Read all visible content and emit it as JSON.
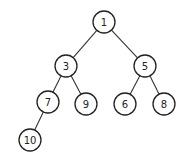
{
  "diagram": {
    "type": "binary-tree",
    "nodes": [
      {
        "id": "n1",
        "label": "1",
        "x": 104,
        "y": 22
      },
      {
        "id": "n3",
        "label": "3",
        "x": 66,
        "y": 66
      },
      {
        "id": "n5",
        "label": "5",
        "x": 145,
        "y": 66
      },
      {
        "id": "n7",
        "label": "7",
        "x": 48,
        "y": 102
      },
      {
        "id": "n9",
        "label": "9",
        "x": 86,
        "y": 104
      },
      {
        "id": "n6",
        "label": "6",
        "x": 125,
        "y": 104
      },
      {
        "id": "n8",
        "label": "8",
        "x": 164,
        "y": 104
      },
      {
        "id": "n10",
        "label": "10",
        "x": 30,
        "y": 140
      }
    ],
    "edges": [
      [
        "n1",
        "n3"
      ],
      [
        "n1",
        "n5"
      ],
      [
        "n3",
        "n7"
      ],
      [
        "n3",
        "n9"
      ],
      [
        "n5",
        "n6"
      ],
      [
        "n5",
        "n8"
      ],
      [
        "n7",
        "n10"
      ]
    ],
    "node_radius": 11
  }
}
